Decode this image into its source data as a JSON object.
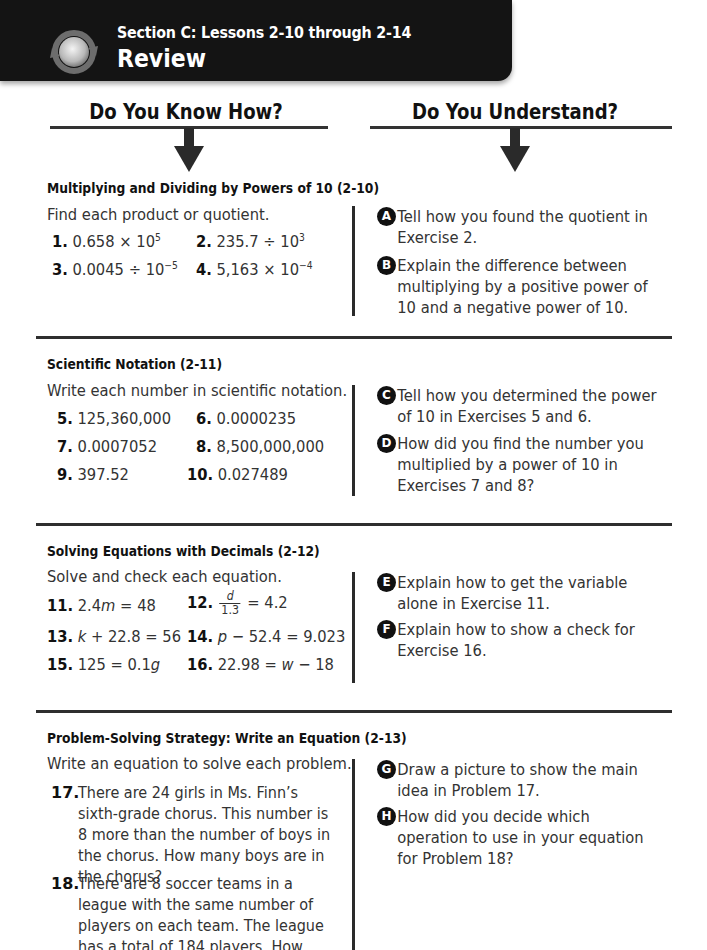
{
  "header": {
    "section_label": "Section C: Lessons 2-10 through 2-14",
    "title": "Review",
    "icon": "review-cycle-icon"
  },
  "columns": {
    "left_heading": "Do You Know How?",
    "right_heading": "Do You Understand?"
  },
  "sections": [
    {
      "title": "Multiplying and Dividing by Powers of 10 (2-10)",
      "instruction": "Find each product or quotient.",
      "exercises": [
        {
          "num": "1.",
          "base": "0.658 × 10",
          "exp": "5"
        },
        {
          "num": "2.",
          "base": "235.7 ÷ 10",
          "exp": "3"
        },
        {
          "num": "3.",
          "base": "0.0045 ÷ 10",
          "exp": "−5"
        },
        {
          "num": "4.",
          "base": "5,163 × 10",
          "exp": "−4"
        }
      ],
      "questions": [
        {
          "letter": "A",
          "text": "Tell how you found the quotient in Exercise 2."
        },
        {
          "letter": "B",
          "text": "Explain the difference between multiplying by a positive power of 10 and a negative power of 10."
        }
      ]
    },
    {
      "title": "Scientific Notation (2-11)",
      "instruction": "Write each number in scientific notation.",
      "exercises": [
        {
          "num": "5.",
          "text": "125,360,000"
        },
        {
          "num": "6.",
          "text": "0.0000235"
        },
        {
          "num": "7.",
          "text": "0.0007052"
        },
        {
          "num": "8.",
          "text": "8,500,000,000"
        },
        {
          "num": "9.",
          "text": "397.52"
        },
        {
          "num": "10.",
          "text": "0.027489"
        }
      ],
      "questions": [
        {
          "letter": "C",
          "text": "Tell how you determined the power of 10 in Exercises 5 and 6."
        },
        {
          "letter": "D",
          "text": "How did you find the number you multiplied by a power of 10 in Exercises 7 and 8?"
        }
      ]
    },
    {
      "title": "Solving Equations with Decimals (2-12)",
      "instruction": "Solve and check each equation.",
      "exercises": [
        {
          "num": "11.",
          "pre": "2.4",
          "var": "m",
          "post": " = 48"
        },
        {
          "num": "12.",
          "frac_top": "d",
          "frac_bot": "1.3",
          "post": " = 4.2"
        },
        {
          "num": "13.",
          "pre": "",
          "var": "k",
          "post": " + 22.8 = 56"
        },
        {
          "num": "14.",
          "pre": "",
          "var": "p",
          "post": " − 52.4 = 9.023"
        },
        {
          "num": "15.",
          "pre": "125 = 0.1",
          "var": "g",
          "post": ""
        },
        {
          "num": "16.",
          "pre": "22.98 = ",
          "var": "w",
          "post": " − 18"
        }
      ],
      "questions": [
        {
          "letter": "E",
          "text": "Explain how to get the variable alone in Exercise 11."
        },
        {
          "letter": "F",
          "text": "Explain how to show a check for Exercise 16."
        }
      ]
    },
    {
      "title": "Problem-Solving Strategy: Write an Equation (2-13)",
      "instruction": "Write an equation to solve each problem.",
      "problems": [
        {
          "num": "17.",
          "text": "There are 24 girls in Ms. Finn’s sixth-grade chorus. This number is 8 more than the number of boys in the chorus. How many boys are in the chorus?"
        },
        {
          "num": "18.",
          "text": "There are 8 soccer teams in a league with the same number of players on each team. The league has a total of 184 players. How many players are"
        }
      ],
      "questions": [
        {
          "letter": "G",
          "text": "Draw a picture to show the main idea in Problem 17."
        },
        {
          "letter": "H",
          "text": "How did you decide which operation to use in your equation for Problem 18?"
        }
      ]
    }
  ]
}
